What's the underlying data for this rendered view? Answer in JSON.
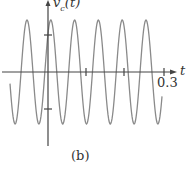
{
  "chart_data": {
    "type": "line",
    "title": "",
    "caption": "(b)",
    "xlabel": "t",
    "ylabel": "v_c(t)",
    "x_ticks": [
      0.1,
      0.2,
      0.3
    ],
    "x_tick_labels_shown": [
      "0.3"
    ],
    "y_ticks_marked": 2,
    "series": [
      {
        "name": "v_c(t)",
        "shape": "sinusoid",
        "cycles_visible": 6.5,
        "x_range": [
          -0.035,
          0.3
        ],
        "amplitude": "constant",
        "color": "#888888"
      }
    ],
    "grid": false
  },
  "labels": {
    "ylabel_main": "v",
    "ylabel_sub": "c",
    "ylabel_arg": "(t)",
    "xlabel": "t",
    "tick_03": "0.3",
    "caption": "(b)"
  }
}
